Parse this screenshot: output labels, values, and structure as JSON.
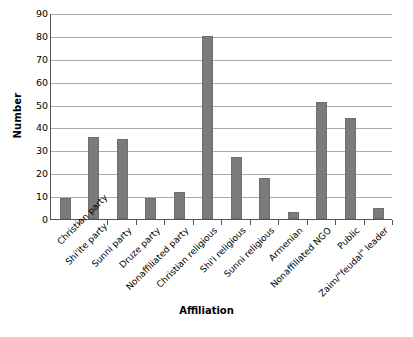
{
  "chart_data": {
    "type": "bar",
    "title": "",
    "subtitle": "",
    "xlabel": "Affiliation",
    "ylabel": "Number",
    "ylim": [
      0,
      90
    ],
    "ytick_step": 10,
    "yticks": [
      0,
      10,
      20,
      30,
      40,
      50,
      60,
      70,
      80,
      90
    ],
    "ytick_labels": [
      "0",
      "10",
      "20",
      "30",
      "40",
      "50",
      "60",
      "70",
      "80",
      "90"
    ],
    "grid": true,
    "grid_axis": "y",
    "legend": false,
    "legend_position": "none",
    "bar_color": "#7b7b7b",
    "axis_color": "#555555",
    "gridline_color": "#aaaaaa",
    "background": "#ffffff",
    "xtick_rotation": -45,
    "categories": [
      "Christian party",
      "Shi'ite party",
      "Sunni party",
      "Druze party",
      "Nonaffiliated party",
      "Christian religious",
      "Shi'i religious",
      "Sunni religious",
      "Armenian",
      "Nonaffiliated NGO",
      "Public",
      "Zaim/\"feudal\" leader"
    ],
    "values": [
      9,
      36,
      35,
      9,
      12,
      80,
      27,
      18,
      3,
      51,
      44,
      5
    ]
  }
}
